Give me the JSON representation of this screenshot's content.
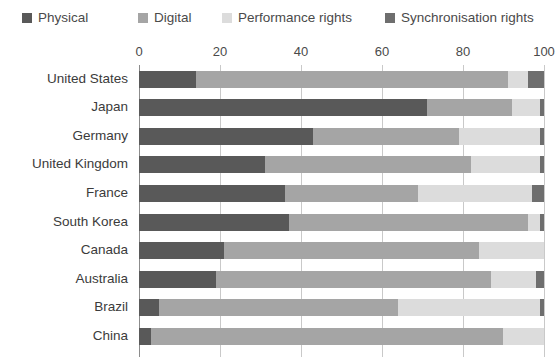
{
  "legend": {
    "items": [
      {
        "label": "Physical",
        "color": "#595959",
        "key": "physical"
      },
      {
        "label": "Digital",
        "color": "#a5a5a5",
        "key": "digital"
      },
      {
        "label": "Performance rights",
        "color": "#dcdcdc",
        "key": "performance"
      },
      {
        "label": "Synchronisation rights",
        "color": "#6e6e6e",
        "key": "synchronisation"
      }
    ]
  },
  "axis": {
    "ticks": [
      "0",
      "20",
      "40",
      "60",
      "80",
      "100"
    ],
    "min": 0,
    "max": 100
  },
  "chart_data": {
    "type": "bar",
    "orientation": "horizontal",
    "stacked": true,
    "stacked_percent": true,
    "title": "",
    "subtitle": "",
    "xlabel": "",
    "ylabel": "",
    "xlim": [
      0,
      100
    ],
    "grid": true,
    "legend_position": "top",
    "tick_labels": [
      "0",
      "20",
      "40",
      "60",
      "80",
      "100"
    ],
    "categories": [
      "United States",
      "Japan",
      "Germany",
      "United Kingdom",
      "France",
      "South Korea",
      "Canada",
      "Australia",
      "Brazil",
      "China"
    ],
    "series": [
      {
        "name": "Physical",
        "color": "#595959",
        "values": [
          14,
          71,
          43,
          31,
          36,
          37,
          21,
          19,
          5,
          3
        ]
      },
      {
        "name": "Digital",
        "color": "#a5a5a5",
        "values": [
          77,
          21,
          36,
          51,
          33,
          59,
          63,
          68,
          59,
          87
        ]
      },
      {
        "name": "Performance rights",
        "color": "#dcdcdc",
        "values": [
          5,
          7,
          20,
          17,
          28,
          3,
          16,
          11,
          35,
          10
        ]
      },
      {
        "name": "Synchronisation rights",
        "color": "#6e6e6e",
        "values": [
          4,
          1,
          1,
          1,
          3,
          1,
          0,
          2,
          1,
          0
        ]
      }
    ]
  }
}
